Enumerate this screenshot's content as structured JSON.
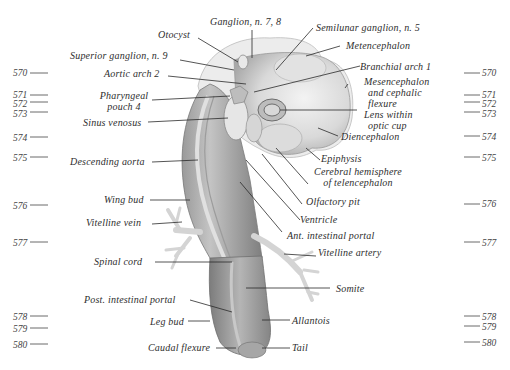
{
  "figure": {
    "colors": {
      "background": "#ffffff",
      "tissue_light": "#e6e6e6",
      "tissue_mid": "#bdbdbd",
      "tissue_dark": "#8e8e8e",
      "leader": "#2a2a2a",
      "text": "#2e2e2e"
    }
  },
  "labels_top": {
    "ganglion_7_8": "Ganglion, n. 7, 8",
    "otocyst": "Otocyst",
    "semilunar": "Semilunar ganglion, n. 5"
  },
  "labels_left": {
    "superior_ganglion": "Superior ganglion, n. 9",
    "aortic_arch": "Aortic arch 2",
    "pharyngeal_1": "Pharyngeal",
    "pharyngeal_2": "pouch 4",
    "sinus_venosus": "Sinus venosus",
    "descending_aorta": "Descending aorta",
    "wing_bud": "Wing bud",
    "vitelline_vein": "Vitelline vein",
    "spinal_cord": "Spinal cord",
    "post_portal": "Post. intestinal portal",
    "leg_bud": "Leg bud",
    "caudal_flexure": "Caudal flexure"
  },
  "labels_right": {
    "metencephalon": "Metencephalon",
    "branchial_arch": "Branchial arch 1",
    "mesencephalon_1": "Mesencephalon",
    "mesencephalon_2": "and cephalic",
    "mesencephalon_3": "flexure",
    "lens_1": "Lens within",
    "lens_2": "optic cup",
    "diencephalon": "Diencephalon",
    "epiphysis": "Epiphysis",
    "cerebral_1": "Cerebral hemisphere",
    "cerebral_2": "of telencephalon",
    "olfactory": "Olfactory pit",
    "ventricle": "Ventricle",
    "ant_portal": "Ant. intestinal portal",
    "vitelline_artery": "Vitelline artery",
    "somite": "Somite",
    "allantois": "Allantois",
    "tail": "Tail"
  },
  "scale_left": [
    "570",
    "571",
    "572",
    "573",
    "574",
    "575",
    "576",
    "577",
    "578",
    "579",
    "580"
  ],
  "scale_right": [
    "570",
    "571",
    "572",
    "573",
    "574",
    "575",
    "576",
    "577",
    "578",
    "579",
    "580"
  ]
}
